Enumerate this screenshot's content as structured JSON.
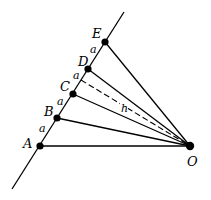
{
  "diagram": {
    "colors": {
      "stroke": "#000000",
      "background": "#ffffff"
    },
    "main_line": {
      "x1": 124,
      "y1": 12,
      "x2": 12,
      "y2": 189
    },
    "points": [
      {
        "name": "A",
        "label": "A",
        "x": 40,
        "y": 146,
        "lx": 23,
        "ly": 148
      },
      {
        "name": "B",
        "label": "B",
        "x": 57,
        "y": 118,
        "lx": 44,
        "ly": 116
      },
      {
        "name": "C",
        "label": "C",
        "x": 73,
        "y": 94,
        "lx": 60,
        "ly": 91
      },
      {
        "name": "D",
        "label": "D",
        "x": 88,
        "y": 69,
        "lx": 78,
        "ly": 66
      },
      {
        "name": "E",
        "label": "E",
        "x": 105,
        "y": 42,
        "lx": 92,
        "ly": 38
      }
    ],
    "origin": {
      "name": "O",
      "label": "O",
      "x": 190,
      "y": 146,
      "lx": 187,
      "ly": 166
    },
    "segment_labels": [
      {
        "text": "a",
        "x": 39,
        "y": 132
      },
      {
        "text": "a",
        "x": 57,
        "y": 105
      },
      {
        "text": "a",
        "x": 73,
        "y": 79
      },
      {
        "text": "a",
        "x": 90,
        "y": 53
      }
    ],
    "perpendicular": {
      "x1": 81,
      "y1": 80,
      "x2": 190,
      "y2": 146,
      "label": "h",
      "lx": 121,
      "ly": 112
    }
  }
}
